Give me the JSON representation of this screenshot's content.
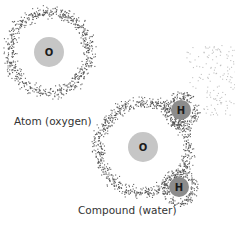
{
  "diagram": {
    "atom": {
      "label": "Atom (oxygen)",
      "nucleus": {
        "symbol": "O",
        "cx": 49,
        "cy": 52,
        "r": 15,
        "color": "#c6c6c6"
      },
      "electron_ring": {
        "cx": 49,
        "cy": 52,
        "r": 40,
        "width": 9,
        "dot_count": 700
      }
    },
    "compound": {
      "label": "Compound (water)",
      "oxygen": {
        "nucleus": {
          "symbol": "O",
          "cx": 143,
          "cy": 147,
          "r": 15,
          "color": "#c6c6c6"
        },
        "electron_ring": {
          "cx": 143,
          "cy": 147,
          "r": 45,
          "width": 9,
          "dot_count": 800
        }
      },
      "hydrogens": [
        {
          "symbol": "H",
          "cx": 181,
          "cy": 110,
          "r": 10,
          "color": "#8c8c8c",
          "cloud_r": 15,
          "dot_count": 200
        },
        {
          "symbol": "H",
          "cx": 179,
          "cy": 187,
          "r": 10,
          "color": "#8c8c8c",
          "cloud_r": 15,
          "dot_count": 200
        }
      ],
      "diffuse_cloud": {
        "x0": 185,
        "y0": 45,
        "x1": 235,
        "y1": 115,
        "dot_count": 220,
        "color": "#b5b5b5"
      }
    },
    "dot_color": "#4a4a4a"
  }
}
